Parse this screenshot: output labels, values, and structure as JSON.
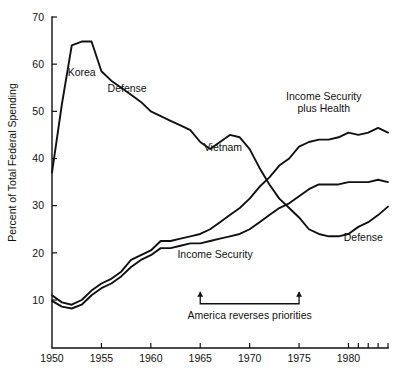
{
  "chart_data": {
    "type": "line",
    "title": "",
    "subtitle": "",
    "xlabel": "",
    "ylabel": "Percent of Total Federal Spending",
    "xlim": [
      1950,
      1984
    ],
    "ylim": [
      0,
      70
    ],
    "grid": false,
    "legend_position": "inline-labels",
    "y_ticks": [
      10,
      20,
      30,
      40,
      50,
      60,
      70
    ],
    "y_tick_labels": [
      "10",
      "20",
      "30",
      "40",
      "50",
      "60",
      "70"
    ],
    "x_ticks": [
      1950,
      1955,
      1960,
      1965,
      1970,
      1975,
      1980
    ],
    "x_tick_labels": [
      "1950",
      "1955",
      "1960",
      "1965",
      "1970",
      "1975",
      "1980"
    ],
    "x_minor_ticks": [
      1981,
      1982,
      1983,
      1984
    ],
    "series": [
      {
        "name": "Defense",
        "x": [
          1950,
          1951,
          1952,
          1953,
          1954,
          1955,
          1956,
          1957,
          1958,
          1959,
          1960,
          1961,
          1962,
          1963,
          1964,
          1965,
          1966,
          1967,
          1968,
          1969,
          1970,
          1971,
          1972,
          1973,
          1974,
          1975,
          1976,
          1977,
          1978,
          1979,
          1980,
          1981,
          1982,
          1983,
          1984
        ],
        "values": [
          37.0,
          51.5,
          64.0,
          64.8,
          64.8,
          58.5,
          56.5,
          55.0,
          53.5,
          52.0,
          50.0,
          49.0,
          48.0,
          47.0,
          46.0,
          43.5,
          42.0,
          43.5,
          45.0,
          44.5,
          42.0,
          38.0,
          34.5,
          31.5,
          29.5,
          27.5,
          25.0,
          24.0,
          23.5,
          23.5,
          24.0,
          25.5,
          26.5,
          28.0,
          29.8
        ]
      },
      {
        "name": "Income Security plus Health",
        "x": [
          1950,
          1951,
          1952,
          1953,
          1954,
          1955,
          1956,
          1957,
          1958,
          1959,
          1960,
          1961,
          1962,
          1963,
          1964,
          1965,
          1966,
          1967,
          1968,
          1969,
          1970,
          1971,
          1972,
          1973,
          1974,
          1975,
          1976,
          1977,
          1978,
          1979,
          1980,
          1981,
          1982,
          1983,
          1984
        ],
        "values": [
          11.0,
          9.5,
          9.0,
          10.0,
          12.0,
          13.5,
          14.5,
          16.0,
          18.5,
          19.5,
          20.5,
          22.5,
          22.5,
          23.0,
          23.5,
          24.0,
          25.0,
          26.5,
          28.0,
          29.5,
          31.5,
          34.0,
          36.0,
          38.5,
          40.0,
          42.5,
          43.5,
          44.0,
          44.0,
          44.5,
          45.5,
          45.0,
          45.5,
          46.5,
          45.5
        ]
      },
      {
        "name": "Income Security",
        "x": [
          1950,
          1951,
          1952,
          1953,
          1954,
          1955,
          1956,
          1957,
          1958,
          1959,
          1960,
          1961,
          1962,
          1963,
          1964,
          1965,
          1966,
          1967,
          1968,
          1969,
          1970,
          1971,
          1972,
          1973,
          1974,
          1975,
          1976,
          1977,
          1978,
          1979,
          1980,
          1981,
          1982,
          1983,
          1984
        ],
        "values": [
          9.8,
          8.6,
          8.2,
          9.0,
          11.0,
          12.5,
          13.5,
          15.0,
          17.0,
          18.5,
          19.5,
          21.0,
          21.0,
          21.5,
          22.0,
          22.0,
          22.5,
          23.0,
          23.5,
          24.0,
          25.0,
          26.5,
          28.0,
          29.5,
          30.5,
          32.0,
          33.5,
          34.5,
          34.5,
          34.5,
          35.0,
          35.0,
          35.0,
          35.5,
          35.0
        ]
      }
    ],
    "inline_labels": [
      {
        "text": "Korea",
        "x": 1953.0,
        "y": 57.5
      },
      {
        "text": "Defense",
        "x": 1957.6,
        "y": 54.0
      },
      {
        "text": "Vietnam",
        "x": 1967.3,
        "y": 41.5
      },
      {
        "text": "Income Security\nplus Health",
        "x": 1977.5,
        "y": 52.5
      },
      {
        "text": "Income Security",
        "x": 1966.5,
        "y": 19.0
      },
      {
        "text": "Defense",
        "x": 1981.5,
        "y": 22.5
      }
    ],
    "annotation": {
      "text": "America reverses priorities",
      "x_start": 1965,
      "x_end": 1975,
      "y_bracket": 9.2,
      "label_y": 6.0
    }
  },
  "labels": {
    "ylabel": "Percent of Total Federal Spending",
    "korea": "Korea",
    "defense_upper": "Defense",
    "vietnam": "Vietnam",
    "income_security_plus_health_line1": "Income Security",
    "income_security_plus_health_line2": "plus Health",
    "income_security": "Income Security",
    "defense_lower": "Defense",
    "annotation": "America reverses priorities",
    "y_10": "10",
    "y_20": "20",
    "y_30": "30",
    "y_40": "40",
    "y_50": "50",
    "y_60": "60",
    "y_70": "70",
    "x_1950": "1950",
    "x_1955": "1955",
    "x_1960": "1960",
    "x_1965": "1965",
    "x_1970": "1970",
    "x_1975": "1975",
    "x_1980": "1980"
  },
  "colors": {
    "ink": "#111111",
    "background": "#ffffff"
  }
}
